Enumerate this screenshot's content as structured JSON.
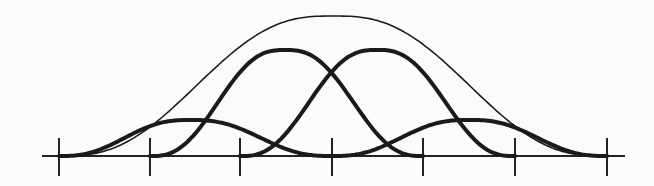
{
  "diagram": {
    "type": "bell-curve-basis-functions",
    "colors": {
      "stroke": "#1a1a1a",
      "background": "#fbfbfa"
    },
    "axis": {
      "x_start": 42,
      "x_end": 625,
      "y": 156
    },
    "ticks": {
      "x": [
        59,
        150,
        240,
        332,
        423,
        515,
        607
      ],
      "y_top": 138,
      "y_bottom": 176
    },
    "basis_curves": [
      {
        "name": "small-left",
        "start": 59,
        "end": 332,
        "peak_x": 190,
        "peak_y": 120
      },
      {
        "name": "large-left",
        "start": 150,
        "end": 423,
        "peak_x": 285,
        "peak_y": 50
      },
      {
        "name": "large-right",
        "start": 240,
        "end": 515,
        "peak_x": 377,
        "peak_y": 50
      },
      {
        "name": "small-right",
        "start": 332,
        "end": 607,
        "peak_x": 469,
        "peak_y": 120
      }
    ],
    "envelope": {
      "start": 59,
      "end": 607,
      "peak_x": 333,
      "peak_y": 16
    }
  }
}
